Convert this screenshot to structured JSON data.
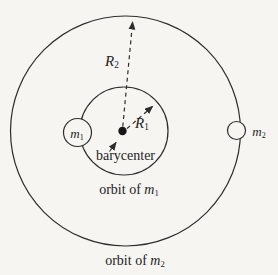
{
  "diagram": {
    "colors": {
      "background": "#f6f5f2",
      "line": "#2e2d2b",
      "text": "#1e1e1e",
      "body_fill": "#f6f5f2"
    },
    "labels": {
      "barycenter": "barycenter",
      "m1": {
        "base": "m",
        "sub": "1"
      },
      "m2": {
        "base": "m",
        "sub": "2"
      },
      "r1": {
        "base": "R",
        "sub": "1"
      },
      "r2": {
        "base": "R",
        "sub": "2"
      },
      "orbit_m1": {
        "prefix": "orbit of ",
        "base": "m",
        "sub": "1"
      },
      "orbit_m2": {
        "prefix": "orbit of ",
        "base": "m",
        "sub": "2"
      }
    }
  }
}
